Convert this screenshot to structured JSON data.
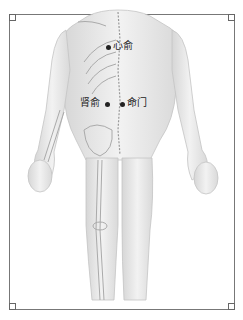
{
  "diagram": {
    "points": [
      {
        "label": "心俞",
        "dot_x": 108,
        "dot_y": 47,
        "label_x": 114,
        "label_y": 41
      },
      {
        "label": "肾俞",
        "dot_x": 107,
        "dot_y": 104,
        "label_x": 80,
        "label_y": 98
      },
      {
        "label": "命门",
        "dot_x": 122,
        "dot_y": 104,
        "label_x": 127,
        "label_y": 98
      }
    ],
    "colors": {
      "frame": "#777777",
      "body": "#e8e8e8",
      "dot": "#222222"
    }
  }
}
